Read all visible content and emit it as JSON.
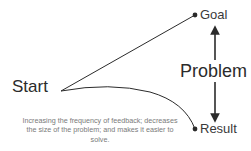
{
  "diagram": {
    "nodes": {
      "start": "Start",
      "goal": "Goal",
      "result": "Result",
      "problem": "Problem"
    },
    "caption": "Increasing the frequency of feedback; decreases the size of the problem; and makes it easier to solve.",
    "edges": [
      {
        "from": "Start",
        "to": "Goal",
        "style": "straight line"
      },
      {
        "from": "Start",
        "to": "Result",
        "style": "curved line"
      },
      {
        "from": "Problem",
        "to": "Goal",
        "style": "arrow"
      },
      {
        "from": "Problem",
        "to": "Result",
        "style": "arrow"
      }
    ],
    "colors": {
      "line": "#2b2b2b",
      "text": "#333333",
      "caption": "#7a7a7a"
    }
  }
}
